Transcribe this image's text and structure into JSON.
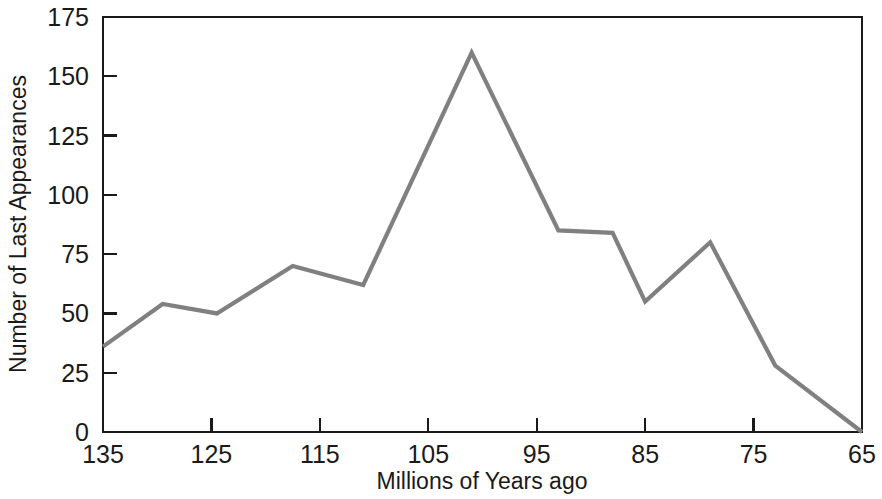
{
  "chart_data": {
    "type": "line",
    "title": "",
    "xlabel": "Millions of Years ago",
    "ylabel": "Number of Last Appearances",
    "x": [
      135,
      129.5,
      124.5,
      117.5,
      111,
      101,
      93,
      88,
      85,
      79,
      73,
      65
    ],
    "values": [
      36,
      54,
      50,
      70,
      62,
      160,
      85,
      84,
      55,
      80,
      28,
      0
    ],
    "series": [
      {
        "name": "Last Appearances",
        "values": [
          36,
          54,
          50,
          70,
          62,
          160,
          85,
          84,
          55,
          80,
          28,
          0
        ]
      }
    ],
    "xlim": [
      135,
      65
    ],
    "ylim": [
      0,
      175
    ],
    "x_ticks": [
      135,
      125,
      115,
      105,
      95,
      85,
      75,
      65
    ],
    "x_tick_labels": [
      "135",
      "125",
      "115",
      "105",
      "95",
      "85",
      "75",
      "65"
    ],
    "y_ticks": [
      0,
      25,
      50,
      75,
      100,
      125,
      150,
      175
    ],
    "y_tick_labels": [
      "0",
      "25",
      "50",
      "75",
      "100",
      "125",
      "150",
      "175"
    ],
    "grid": false,
    "legend": "none",
    "x_axis_inverted": true,
    "line_color": "#808080",
    "axis_color": "#1a1a1a",
    "background_color": "#ffffff"
  },
  "axes": {
    "x_title": "Millions of Years ago",
    "y_title": "Number of Last Appearances"
  }
}
